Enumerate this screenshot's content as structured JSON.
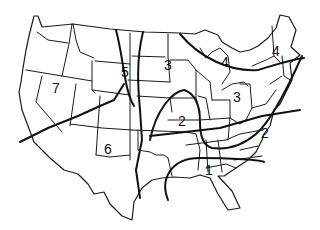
{
  "map": {
    "subject": "Contiguous United States with state boundaries",
    "colors": {
      "line": "#111111",
      "background": "#ffffff"
    },
    "zone_labels": [
      {
        "id": "zone-7",
        "text": "7",
        "x": 52,
        "y": 93
      },
      {
        "id": "zone-5",
        "text": "5",
        "x": 121,
        "y": 77
      },
      {
        "id": "zone-3-plains",
        "text": "3",
        "x": 164,
        "y": 70
      },
      {
        "id": "zone-4-great-lakes",
        "text": "4",
        "x": 221,
        "y": 67
      },
      {
        "id": "zone-4-new-england",
        "text": "4",
        "x": 272,
        "y": 56
      },
      {
        "id": "zone-3-ohio",
        "text": "3",
        "x": 233,
        "y": 102
      },
      {
        "id": "zone-2-central",
        "text": "2",
        "x": 178,
        "y": 126
      },
      {
        "id": "zone-2-carolinas",
        "text": "2",
        "x": 261,
        "y": 138
      },
      {
        "id": "zone-6",
        "text": "6",
        "x": 104,
        "y": 154
      },
      {
        "id": "zone-1",
        "text": "1",
        "x": 205,
        "y": 175
      }
    ]
  }
}
